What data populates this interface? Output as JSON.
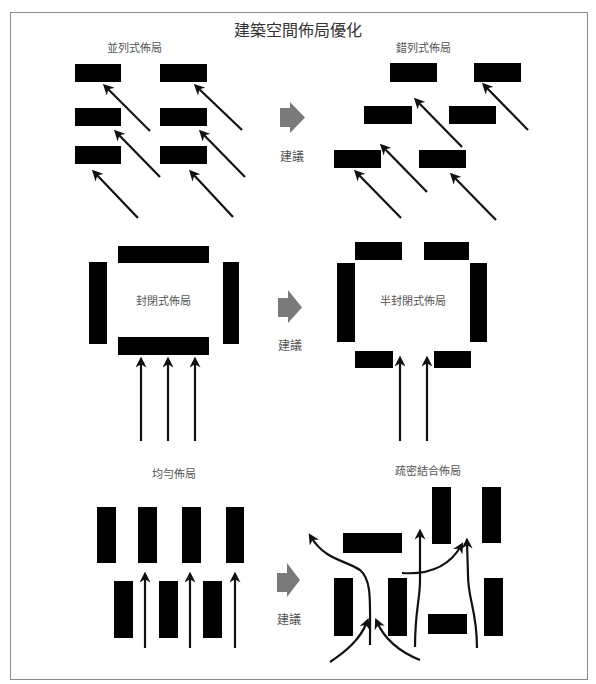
{
  "title": "建築空間佈局優化",
  "colors": {
    "building": "#000000",
    "arrow": "#111111",
    "suggest_arrow": "#7a7a7a",
    "frame": "#8a8a8a",
    "text": "#555555",
    "title": "#333333"
  },
  "labels": {
    "parallel": "並列式佈局",
    "staggered": "錯列式佈局",
    "closed": "封閉式佈局",
    "semi_closed": "半封閉式佈局",
    "uniform": "均勻佈局",
    "mixed": "疏密結合佈局",
    "suggest_1": "建議",
    "suggest_2": "建議",
    "suggest_3": "建議"
  },
  "text_positions": {
    "title": [
      298,
      29
    ],
    "parallel": [
      134,
      47
    ],
    "staggered": [
      423,
      47
    ],
    "closed": [
      163,
      300
    ],
    "semi_closed": [
      413,
      300
    ],
    "uniform": [
      174,
      473
    ],
    "mixed": [
      428,
      470
    ],
    "suggest_1": [
      292,
      155
    ],
    "suggest_2": [
      290,
      344
    ],
    "suggest_3": [
      289,
      618
    ]
  },
  "groups": [
    {
      "name": "parallel-layout",
      "buildings": [
        [
          75,
          64,
          46,
          18
        ],
        [
          160,
          64,
          47,
          18
        ],
        [
          75,
          108,
          46,
          18
        ],
        [
          160,
          108,
          47,
          18
        ],
        [
          75,
          146,
          46,
          18
        ],
        [
          160,
          146,
          47,
          18
        ]
      ],
      "arrows": [
        [
          150,
          131,
          106,
          87
        ],
        [
          160,
          177,
          117,
          133
        ],
        [
          138,
          218,
          95,
          173
        ],
        [
          242,
          130,
          197,
          87
        ],
        [
          245,
          177,
          202,
          133
        ],
        [
          233,
          217,
          192,
          173
        ]
      ],
      "curves": []
    },
    {
      "name": "staggered-layout",
      "buildings": [
        [
          390,
          63,
          47,
          19
        ],
        [
          474,
          63,
          47,
          19
        ],
        [
          364,
          106,
          48,
          18
        ],
        [
          449,
          106,
          47,
          18
        ],
        [
          334,
          150,
          47,
          18
        ],
        [
          419,
          150,
          47,
          18
        ]
      ],
      "arrows": [
        [
          528,
          130,
          485,
          86
        ],
        [
          462,
          147,
          417,
          101
        ],
        [
          427,
          192,
          383,
          147
        ],
        [
          401,
          218,
          357,
          173
        ],
        [
          496,
          220,
          453,
          176
        ]
      ],
      "curves": []
    },
    {
      "name": "closed-layout",
      "buildings": [
        [
          118,
          246,
          91,
          17
        ],
        [
          89,
          262,
          18,
          82
        ],
        [
          223,
          262,
          16,
          82
        ],
        [
          118,
          337,
          91,
          18
        ]
      ],
      "arrows": [
        [
          141,
          441,
          141,
          361
        ],
        [
          168,
          441,
          168,
          361
        ],
        [
          195,
          441,
          195,
          361
        ]
      ],
      "curves": []
    },
    {
      "name": "semi-closed-layout",
      "buildings": [
        [
          355,
          242,
          47,
          18
        ],
        [
          424,
          242,
          45,
          18
        ],
        [
          337,
          263,
          18,
          79
        ],
        [
          470,
          263,
          17,
          79
        ],
        [
          355,
          351,
          38,
          17
        ],
        [
          434,
          351,
          37,
          17
        ]
      ],
      "arrows": [
        [
          400,
          441,
          400,
          360
        ],
        [
          427,
          441,
          427,
          360
        ]
      ],
      "curves": []
    },
    {
      "name": "uniform-layout",
      "buildings": [
        [
          97,
          507,
          19,
          56
        ],
        [
          138,
          507,
          19,
          56
        ],
        [
          182,
          507,
          19,
          56
        ],
        [
          226,
          507,
          18,
          56
        ],
        [
          114,
          581,
          19,
          57
        ],
        [
          159,
          581,
          19,
          57
        ],
        [
          203,
          581,
          19,
          57
        ]
      ],
      "arrows": [
        [
          145,
          648,
          145,
          576
        ],
        [
          190,
          648,
          190,
          576
        ],
        [
          235,
          648,
          235,
          576
        ]
      ],
      "curves": []
    },
    {
      "name": "mixed-layout",
      "buildings": [
        [
          343,
          533,
          59,
          20
        ],
        [
          432,
          487,
          19,
          57
        ],
        [
          482,
          487,
          19,
          56
        ],
        [
          334,
          578,
          19,
          58
        ],
        [
          388,
          578,
          19,
          58
        ],
        [
          428,
          614,
          39,
          20
        ],
        [
          484,
          578,
          19,
          58
        ]
      ],
      "arrows": [],
      "curves": [
        "M370 645 C370 600 372 580 360 570 C345 560 325 560 311 537",
        "M330 662 C345 652 360 640 367 622",
        "M420 660 C400 652 385 640 377 622",
        "M415 647 C415 610 420 600 420 580 L420 533",
        "M402 573 C430 575 450 565 461 546",
        "M477 648 C477 610 468 600 468 575 L467 542"
      ]
    }
  ],
  "suggest_arrows": [
    {
      "shaft": [
        280,
        108,
        10,
        19
      ],
      "head": [
        [
          290,
          102
        ],
        [
          305,
          117.5
        ],
        [
          290,
          133
        ]
      ]
    },
    {
      "shaft": [
        278,
        298,
        10,
        19
      ],
      "head": [
        [
          288,
          290
        ],
        [
          302,
          307.5
        ],
        [
          288,
          323
        ]
      ]
    },
    {
      "shaft": [
        277,
        573,
        10,
        19
      ],
      "head": [
        [
          287,
          563
        ],
        [
          300,
          580
        ],
        [
          287,
          597
        ]
      ]
    }
  ]
}
